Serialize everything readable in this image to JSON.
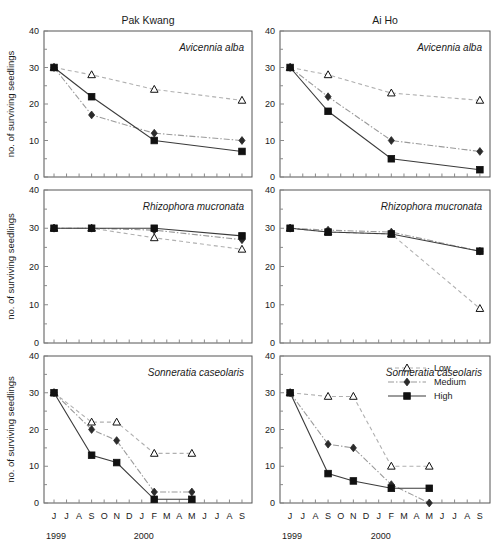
{
  "figure": {
    "y_axis_label": "no. of surviving seedlings",
    "column_titles": [
      "Pak Kwang",
      "Ai Ho"
    ],
    "row_species": [
      "Avicennia alba",
      "Rhizophora mucronata",
      "Sonneratia caseolaris"
    ],
    "y_ticks": [
      0,
      10,
      20,
      30,
      40
    ],
    "ylim": [
      0,
      40
    ],
    "x_tick_labels": [
      "J",
      "J",
      "A",
      "S",
      "O",
      "N",
      "D",
      "J",
      "F",
      "M",
      "A",
      "M",
      "J",
      "J",
      "A",
      "S"
    ],
    "x_year_labels": [
      {
        "label": "1999",
        "index": 0
      },
      {
        "label": "2000",
        "index": 7
      }
    ],
    "legend": {
      "position": "top-right of bottom-right panel",
      "entries": [
        {
          "name": "Low",
          "marker": "open-triangle",
          "line": "dashed",
          "color": "#111111"
        },
        {
          "name": "Medium",
          "marker": "filled-diamond",
          "line": "dash-dot",
          "color": "#2b2b2b"
        },
        {
          "name": "High",
          "marker": "filled-square",
          "line": "solid",
          "color": "#111111"
        }
      ]
    }
  },
  "chart_data": [
    {
      "type": "line",
      "panel": "Pak Kwang - Avicennia alba",
      "title": "Pak Kwang",
      "annotation": "Avicennia alba",
      "xlabel": "",
      "ylabel": "no. of surviving seedlings",
      "ylim": [
        0,
        40
      ],
      "x_months": [
        "J",
        "J",
        "A",
        "S",
        "O",
        "N",
        "D",
        "J",
        "F",
        "M",
        "A",
        "M",
        "J",
        "J",
        "A",
        "S"
      ],
      "sample_months": [
        "J-1999",
        "S-1999",
        "F-2000",
        "S-2000"
      ],
      "sample_indices": [
        0,
        3,
        8,
        15
      ],
      "series": [
        {
          "name": "Low",
          "values": [
            30,
            28,
            24,
            21
          ]
        },
        {
          "name": "Medium",
          "values": [
            30,
            17,
            12,
            10
          ]
        },
        {
          "name": "High",
          "values": [
            30,
            22,
            10,
            7
          ]
        }
      ]
    },
    {
      "type": "line",
      "panel": "Ai Ho - Avicennia alba",
      "title": "Ai Ho",
      "annotation": "Avicennia alba",
      "xlabel": "",
      "ylabel": "no. of surviving seedlings",
      "ylim": [
        0,
        40
      ],
      "x_months": [
        "J",
        "J",
        "A",
        "S",
        "O",
        "N",
        "D",
        "J",
        "F",
        "M",
        "A",
        "M",
        "J",
        "J",
        "A",
        "S"
      ],
      "sample_months": [
        "J-1999",
        "S-1999",
        "F-2000",
        "S-2000"
      ],
      "sample_indices": [
        0,
        3,
        8,
        15
      ],
      "series": [
        {
          "name": "Low",
          "values": [
            30,
            28,
            23,
            21
          ]
        },
        {
          "name": "Medium",
          "values": [
            30,
            22,
            10,
            7
          ]
        },
        {
          "name": "High",
          "values": [
            30,
            18,
            5,
            2
          ]
        }
      ]
    },
    {
      "type": "line",
      "panel": "Pak Kwang - Rhizophora mucronata",
      "title": "",
      "annotation": "Rhizophora mucronata",
      "xlabel": "",
      "ylabel": "no. of surviving seedlings",
      "ylim": [
        0,
        40
      ],
      "x_months": [
        "J",
        "J",
        "A",
        "S",
        "O",
        "N",
        "D",
        "J",
        "F",
        "M",
        "A",
        "M",
        "J",
        "J",
        "A",
        "S"
      ],
      "sample_months": [
        "J-1999",
        "S-1999",
        "F-2000",
        "S-2000"
      ],
      "sample_indices": [
        0,
        3,
        8,
        15
      ],
      "series": [
        {
          "name": "Low",
          "values": [
            30,
            30,
            27.5,
            24.5
          ]
        },
        {
          "name": "Medium",
          "values": [
            30,
            30,
            29.5,
            27
          ]
        },
        {
          "name": "High",
          "values": [
            30,
            30,
            30,
            28
          ]
        }
      ]
    },
    {
      "type": "line",
      "panel": "Ai Ho - Rhizophora mucronata",
      "title": "",
      "annotation": "Rhizophora mucronata",
      "xlabel": "",
      "ylabel": "no. of surviving seedlings",
      "ylim": [
        0,
        40
      ],
      "x_months": [
        "J",
        "J",
        "A",
        "S",
        "O",
        "N",
        "D",
        "J",
        "F",
        "M",
        "A",
        "M",
        "J",
        "J",
        "A",
        "S"
      ],
      "sample_months": [
        "J-1999",
        "S-1999",
        "F-2000",
        "S-2000"
      ],
      "sample_indices": [
        0,
        3,
        8,
        15
      ],
      "series": [
        {
          "name": "Low",
          "values": [
            30,
            29,
            28.5,
            9
          ]
        },
        {
          "name": "Medium",
          "values": [
            30,
            29.5,
            29,
            24
          ]
        },
        {
          "name": "High",
          "values": [
            30,
            29,
            28.5,
            24
          ]
        }
      ]
    },
    {
      "type": "line",
      "panel": "Pak Kwang - Sonneratia caseolaris",
      "title": "",
      "annotation": "Sonneratia caseolaris",
      "xlabel": "",
      "ylabel": "no. of surviving seedlings",
      "ylim": [
        0,
        40
      ],
      "x_months": [
        "J",
        "J",
        "A",
        "S",
        "O",
        "N",
        "D",
        "J",
        "F",
        "M",
        "A",
        "M",
        "J",
        "J",
        "A",
        "S"
      ],
      "sample_months": [
        "J-1999",
        "S-1999",
        "N-1999",
        "F-2000",
        "M-2000"
      ],
      "sample_indices": [
        0,
        3,
        5,
        8,
        11
      ],
      "series": [
        {
          "name": "Low",
          "values": [
            30,
            22,
            22,
            13.5,
            13.5
          ]
        },
        {
          "name": "Medium",
          "values": [
            30,
            20,
            17,
            3,
            3
          ]
        },
        {
          "name": "High",
          "values": [
            30,
            13,
            11,
            1,
            1
          ]
        }
      ]
    },
    {
      "type": "line",
      "panel": "Ai Ho - Sonneratia caseolaris",
      "title": "",
      "annotation": "Sonneratia caseolaris",
      "xlabel": "",
      "ylabel": "no. of surviving seedlings",
      "ylim": [
        0,
        40
      ],
      "x_months": [
        "J",
        "J",
        "A",
        "S",
        "O",
        "N",
        "D",
        "J",
        "F",
        "M",
        "A",
        "M",
        "J",
        "J",
        "A",
        "S"
      ],
      "sample_months": [
        "J-1999",
        "S-1999",
        "N-1999",
        "F-2000",
        "M-2000"
      ],
      "sample_indices": [
        0,
        3,
        5,
        8,
        11
      ],
      "series": [
        {
          "name": "Low",
          "values": [
            30,
            29,
            29,
            10,
            10
          ]
        },
        {
          "name": "Medium",
          "values": [
            30,
            16,
            15,
            5,
            0
          ]
        },
        {
          "name": "High",
          "values": [
            30,
            8,
            6,
            4,
            4
          ]
        }
      ]
    }
  ]
}
